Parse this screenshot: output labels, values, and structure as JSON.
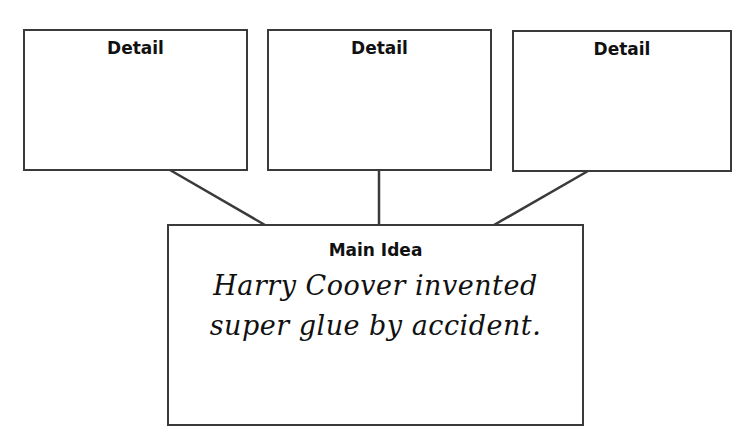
{
  "diagram": {
    "type": "main-idea-detail-organizer",
    "details": [
      {
        "heading": "Detail",
        "body": ""
      },
      {
        "heading": "Detail",
        "body": ""
      },
      {
        "heading": "Detail",
        "body": ""
      }
    ],
    "main_idea": {
      "heading": "Main Idea",
      "lines": [
        "Harry Coover invented",
        "super glue by accident."
      ]
    },
    "colors": {
      "border": "#3a3a3a",
      "text": "#111111",
      "background": "#ffffff"
    }
  }
}
